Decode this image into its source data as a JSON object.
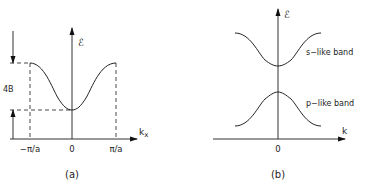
{
  "panel_a": {
    "caption": "(a)",
    "y_axis_label": "ℰ",
    "x_axis_label": "k",
    "x_axis_subscript": "x",
    "tick_labels": [
      "−π/a",
      "0",
      "π/a"
    ],
    "bandwidth_label": "4B"
  },
  "panel_b": {
    "caption": "(b)",
    "y_axis_label": "ℰ",
    "x_axis_label": "k",
    "tick_labels": [
      "0"
    ],
    "upper_band_label": "s−like band",
    "lower_band_label": "p−like band"
  }
}
